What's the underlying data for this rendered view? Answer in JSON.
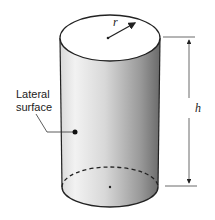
{
  "diagram": {
    "labels": {
      "lateral_line1": "Lateral",
      "lateral_line2": "surface",
      "radius": "r",
      "height": "h"
    },
    "colors": {
      "outline": "#222222",
      "top_face": "#ffffff",
      "shade_light": "#f4f4f4",
      "shade_dark": "#6e6e6e"
    }
  }
}
